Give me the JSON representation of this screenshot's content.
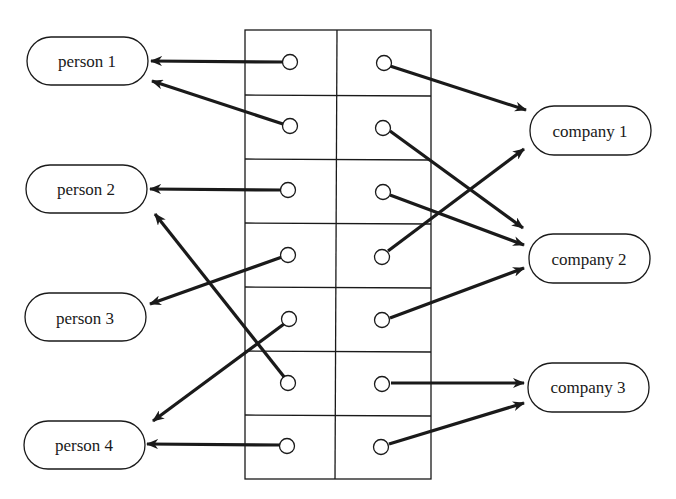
{
  "diagram": {
    "type": "bipartite mapping through table",
    "colors": {
      "stroke": "#1a1a1a",
      "background": "#ffffff",
      "circle_fill": "#ffffff"
    },
    "persons": [
      {
        "id": "p1",
        "label": "person 1"
      },
      {
        "id": "p2",
        "label": "person 2"
      },
      {
        "id": "p3",
        "label": "person 3"
      },
      {
        "id": "p4",
        "label": "person 4"
      }
    ],
    "companies": [
      {
        "id": "c1",
        "label": "company 1"
      },
      {
        "id": "c2",
        "label": "company 2"
      },
      {
        "id": "c3",
        "label": "company 3"
      }
    ],
    "table": {
      "rows": 7,
      "columns": 2,
      "row_links": [
        {
          "row": 1,
          "person": "person 1",
          "company": "company 1"
        },
        {
          "row": 2,
          "person": "person 1",
          "company": "company 2"
        },
        {
          "row": 3,
          "person": "person 2",
          "company": "company 2"
        },
        {
          "row": 4,
          "person": "person 3",
          "company": "company 1"
        },
        {
          "row": 5,
          "person": "person 4",
          "company": "company 2"
        },
        {
          "row": 6,
          "person": "person 2",
          "company": "company 3"
        },
        {
          "row": 7,
          "person": "person 4",
          "company": "company 3"
        }
      ]
    }
  }
}
